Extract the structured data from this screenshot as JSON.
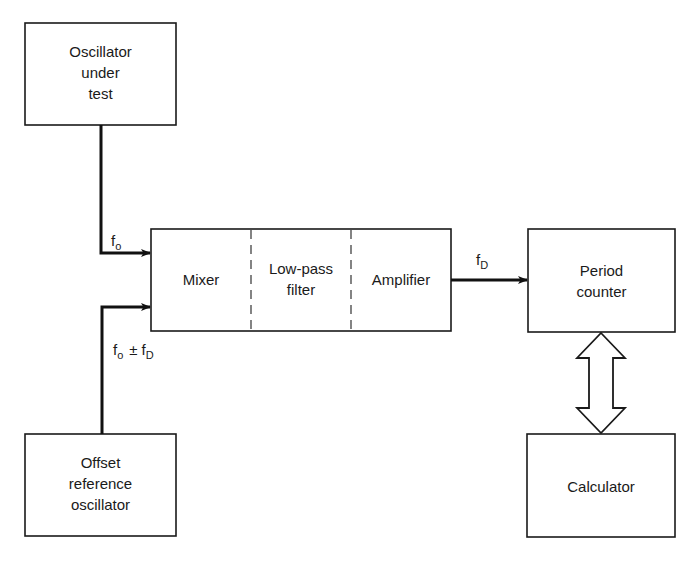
{
  "diagram": {
    "type": "block-diagram",
    "blocks": {
      "osc_under_test": {
        "lines": [
          "Oscillator",
          "under",
          "test"
        ]
      },
      "offset_ref": {
        "lines": [
          "Offset",
          "reference",
          "oscillator"
        ]
      },
      "mixer": {
        "label": "Mixer"
      },
      "lowpass": {
        "lines": [
          "Low-pass",
          "filter"
        ]
      },
      "amplifier": {
        "label": "Amplifier"
      },
      "period_counter": {
        "lines": [
          "Period",
          "counter"
        ]
      },
      "calculator": {
        "label": "Calculator"
      }
    },
    "signals": {
      "fo": {
        "main": "f",
        "sub": "o"
      },
      "fo_pm_fd": {
        "main1": "f",
        "sub1": "o",
        "op": "±",
        "main2": "f",
        "sub2": "D"
      },
      "fd": {
        "main": "f",
        "sub": "D"
      }
    },
    "connections": [
      {
        "from": "Oscillator under test",
        "to": "Mixer",
        "signal": "fo"
      },
      {
        "from": "Offset reference oscillator",
        "to": "Mixer",
        "signal": "fo ± fD"
      },
      {
        "from": "Amplifier",
        "to": "Period counter",
        "signal": "fD"
      },
      {
        "from": "Period counter",
        "to": "Calculator",
        "signal": "bidirectional"
      }
    ],
    "colors": {
      "line": "#111111",
      "background": "#ffffff"
    }
  }
}
